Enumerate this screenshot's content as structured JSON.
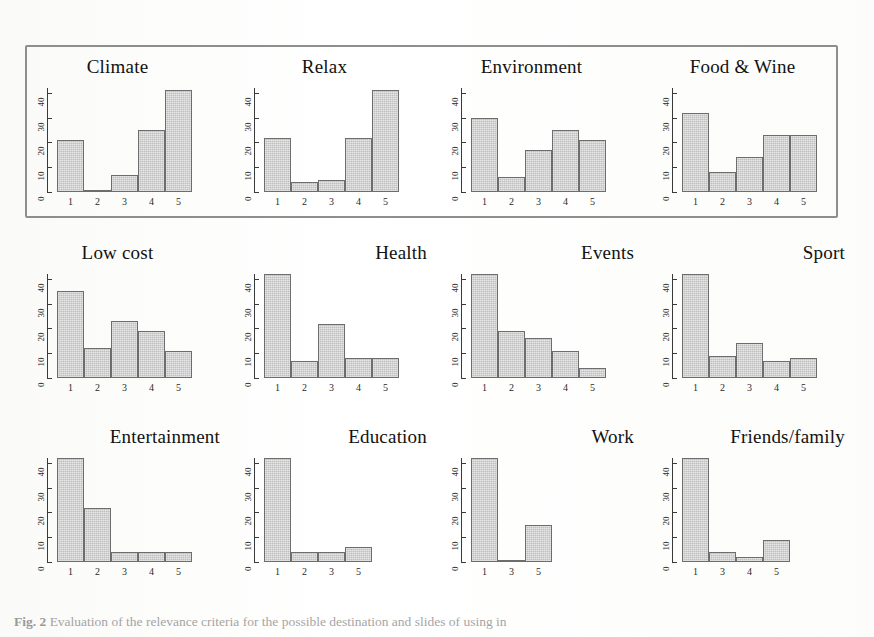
{
  "figure": {
    "caption_label": "Fig. 2",
    "caption_text": "Evaluation of the relevance criteria for the possible destination and slides of using in",
    "highlight_box_color": "#8e8e8e",
    "bar_fill_color": "#c9c9c9",
    "bar_border_color": "#6d6d6d",
    "axis_color": "#3a3a3a",
    "highlighted_row_index": 0
  },
  "chart_data": [
    {
      "type": "bar",
      "title": "Climate",
      "categories": [
        "1",
        "2",
        "3",
        "4",
        "5"
      ],
      "values": [
        21,
        1,
        7,
        25,
        41
      ],
      "xlabel": "",
      "ylabel": "",
      "ylim": [
        0,
        42
      ],
      "yticks": [
        0,
        10,
        20,
        30,
        40
      ],
      "grid": false,
      "highlighted": true
    },
    {
      "type": "bar",
      "title": "Relax",
      "categories": [
        "1",
        "2",
        "3",
        "4",
        "5"
      ],
      "values": [
        22,
        4,
        5,
        22,
        41
      ],
      "xlabel": "",
      "ylabel": "",
      "ylim": [
        0,
        42
      ],
      "yticks": [
        0,
        10,
        20,
        30,
        40
      ],
      "grid": false,
      "highlighted": true
    },
    {
      "type": "bar",
      "title": "Environment",
      "categories": [
        "1",
        "2",
        "3",
        "4",
        "5"
      ],
      "values": [
        30,
        6,
        17,
        25,
        21
      ],
      "xlabel": "",
      "ylabel": "",
      "ylim": [
        0,
        42
      ],
      "yticks": [
        0,
        10,
        20,
        30,
        40
      ],
      "grid": false,
      "highlighted": true
    },
    {
      "type": "bar",
      "title": "Food & Wine",
      "categories": [
        "1",
        "2",
        "3",
        "4",
        "5"
      ],
      "values": [
        32,
        8,
        14,
        23,
        23
      ],
      "xlabel": "",
      "ylabel": "",
      "ylim": [
        0,
        42
      ],
      "yticks": [
        0,
        10,
        20,
        30,
        40
      ],
      "grid": false,
      "highlighted": true
    },
    {
      "type": "bar",
      "title": "Low cost",
      "categories": [
        "1",
        "2",
        "3",
        "4",
        "5"
      ],
      "values": [
        35,
        12,
        23,
        19,
        11
      ],
      "xlabel": "",
      "ylabel": "",
      "ylim": [
        0,
        42
      ],
      "yticks": [
        0,
        10,
        20,
        30,
        40
      ],
      "grid": false,
      "highlighted": false
    },
    {
      "type": "bar",
      "title": "Health",
      "categories": [
        "1",
        "2",
        "3",
        "4",
        "5"
      ],
      "values": [
        50,
        7,
        22,
        8,
        8
      ],
      "xlabel": "",
      "ylabel": "",
      "ylim": [
        0,
        42
      ],
      "yticks": [
        0,
        10,
        20,
        30,
        40
      ],
      "grid": false,
      "highlighted": false
    },
    {
      "type": "bar",
      "title": "Events",
      "categories": [
        "1",
        "2",
        "3",
        "4",
        "5"
      ],
      "values": [
        46,
        19,
        16,
        11,
        4
      ],
      "xlabel": "",
      "ylabel": "",
      "ylim": [
        0,
        42
      ],
      "yticks": [
        0,
        10,
        20,
        30,
        40
      ],
      "grid": false,
      "highlighted": false
    },
    {
      "type": "bar",
      "title": "Sport",
      "categories": [
        "1",
        "2",
        "3",
        "4",
        "5"
      ],
      "values": [
        53,
        9,
        14,
        7,
        8
      ],
      "xlabel": "",
      "ylabel": "",
      "ylim": [
        0,
        42
      ],
      "yticks": [
        0,
        10,
        20,
        30,
        40
      ],
      "grid": false,
      "highlighted": false
    },
    {
      "type": "bar",
      "title": "Entertainment",
      "categories": [
        "1",
        "2",
        "3",
        "4",
        "5"
      ],
      "values": [
        53,
        22,
        4,
        4,
        4
      ],
      "xlabel": "",
      "ylabel": "",
      "ylim": [
        0,
        42
      ],
      "yticks": [
        0,
        10,
        20,
        30,
        40
      ],
      "grid": false,
      "highlighted": false
    },
    {
      "type": "bar",
      "title": "Education",
      "categories": [
        "1",
        "2",
        "3",
        "5"
      ],
      "values": [
        55,
        4,
        4,
        6
      ],
      "xlabel": "",
      "ylabel": "",
      "ylim": [
        0,
        42
      ],
      "yticks": [
        0,
        10,
        20,
        30,
        40
      ],
      "grid": false,
      "highlighted": false
    },
    {
      "type": "bar",
      "title": "Work",
      "categories": [
        "1",
        "3",
        "5"
      ],
      "values": [
        55,
        1,
        15
      ],
      "xlabel": "",
      "ylabel": "",
      "ylim": [
        0,
        42
      ],
      "yticks": [
        0,
        10,
        20,
        30,
        40
      ],
      "grid": false,
      "highlighted": false
    },
    {
      "type": "bar",
      "title": "Friends/family",
      "categories": [
        "1",
        "3",
        "4",
        "5"
      ],
      "values": [
        55,
        4,
        2,
        9
      ],
      "xlabel": "",
      "ylabel": "",
      "ylim": [
        0,
        42
      ],
      "yticks": [
        0,
        10,
        20,
        30,
        40
      ],
      "grid": false,
      "highlighted": false
    }
  ]
}
